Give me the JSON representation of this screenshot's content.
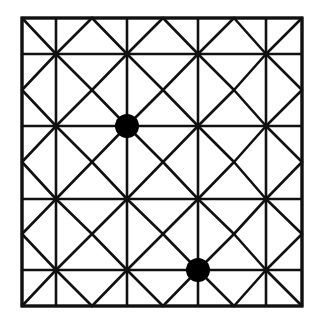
{
  "diagram": {
    "type": "grid-lattice",
    "colors": {
      "line": "#111111",
      "dot": "#000000",
      "background": "#ffffff"
    },
    "border": {
      "x1": 22,
      "y1": 18,
      "x2": 302,
      "y2": 306
    },
    "vertical_lines_x": [
      22,
      56,
      127,
      198,
      266,
      302
    ],
    "horizontal_lines_y": [
      18,
      54,
      126,
      199,
      270,
      306
    ],
    "diagonal_columns_x": [
      22,
      56,
      92,
      127,
      163,
      198,
      234,
      266,
      302
    ],
    "diagonal_rows_y": [
      18,
      54,
      90,
      126,
      162,
      199,
      234,
      270,
      306
    ],
    "dots": [
      {
        "id": "dot-1",
        "cx": 127,
        "cy": 126,
        "r": 12
      },
      {
        "id": "dot-2",
        "cx": 198,
        "cy": 270,
        "r": 12
      }
    ],
    "line_width": 2.6
  }
}
